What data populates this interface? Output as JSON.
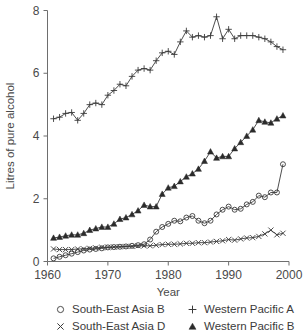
{
  "chart_data": {
    "type": "line",
    "title": "",
    "xlabel": "Year",
    "ylabel": "Litres of pure alcohol",
    "xlim": [
      1960,
      2000
    ],
    "ylim": [
      0,
      8
    ],
    "xticks": [
      1960,
      1970,
      1980,
      1990,
      2000
    ],
    "yticks": [
      0,
      2,
      4,
      6,
      8
    ],
    "xtick_labels": [
      "1960",
      "1970",
      "1980",
      "1990",
      "2000"
    ],
    "ytick_labels": [
      "0",
      "2",
      "4",
      "6",
      "8"
    ],
    "grid": false,
    "legend_position": "below",
    "x": [
      1961,
      1962,
      1963,
      1964,
      1965,
      1966,
      1967,
      1968,
      1969,
      1970,
      1971,
      1972,
      1973,
      1974,
      1975,
      1976,
      1977,
      1978,
      1979,
      1980,
      1981,
      1982,
      1983,
      1984,
      1985,
      1986,
      1987,
      1988,
      1989,
      1990,
      1991,
      1992,
      1993,
      1994,
      1995,
      1996,
      1997,
      1998,
      1999
    ],
    "series": [
      {
        "name": "Western Pacific A",
        "marker": "plus",
        "values": [
          4.55,
          4.6,
          4.72,
          4.75,
          4.5,
          4.72,
          5.0,
          5.05,
          5.0,
          5.3,
          5.45,
          5.65,
          5.6,
          5.9,
          6.1,
          6.15,
          6.1,
          6.4,
          6.65,
          6.7,
          6.6,
          7.0,
          7.35,
          7.15,
          7.2,
          7.15,
          7.2,
          7.8,
          7.1,
          7.4,
          7.1,
          7.2,
          7.2,
          7.2,
          7.15,
          7.1,
          7.0,
          6.85,
          6.75
        ]
      },
      {
        "name": "Western Pacific B",
        "marker": "triangle",
        "values": [
          0.75,
          0.78,
          0.82,
          0.85,
          0.85,
          0.9,
          1.0,
          1.05,
          1.1,
          1.1,
          1.2,
          1.35,
          1.4,
          1.5,
          1.62,
          1.8,
          1.75,
          1.75,
          2.15,
          2.35,
          2.4,
          2.55,
          2.7,
          2.8,
          2.95,
          3.2,
          3.5,
          3.3,
          3.35,
          3.35,
          3.6,
          3.8,
          4.0,
          4.2,
          4.5,
          4.45,
          4.42,
          4.55,
          4.65
        ]
      },
      {
        "name": "South-East Asia B",
        "marker": "circle",
        "values": [
          0.1,
          0.15,
          0.2,
          0.25,
          0.3,
          0.35,
          0.38,
          0.4,
          0.42,
          0.45,
          0.46,
          0.47,
          0.48,
          0.5,
          0.52,
          0.55,
          0.7,
          0.95,
          1.1,
          1.2,
          1.3,
          1.28,
          1.4,
          1.45,
          1.3,
          1.22,
          1.3,
          1.5,
          1.65,
          1.75,
          1.65,
          1.68,
          1.82,
          1.9,
          2.1,
          2.05,
          2.2,
          2.2,
          3.1
        ]
      },
      {
        "name": "South-East Asia D",
        "marker": "cross",
        "values": [
          0.4,
          0.38,
          0.38,
          0.38,
          0.4,
          0.4,
          0.42,
          0.43,
          0.45,
          0.45,
          0.46,
          0.47,
          0.48,
          0.48,
          0.5,
          0.5,
          0.5,
          0.52,
          0.54,
          0.55,
          0.55,
          0.56,
          0.58,
          0.58,
          0.6,
          0.6,
          0.62,
          0.64,
          0.66,
          0.7,
          0.68,
          0.72,
          0.75,
          0.76,
          0.8,
          0.88,
          1.0,
          0.85,
          0.9
        ]
      }
    ]
  },
  "legend": {
    "entries": [
      {
        "label": "South-East Asia B",
        "glyph": "circle-marker-icon"
      },
      {
        "label": "Western Pacific A",
        "glyph": "plus-marker-icon"
      },
      {
        "label": "South-East Asia D",
        "glyph": "cross-marker-icon"
      },
      {
        "label": "Western Pacific B",
        "glyph": "triangle-marker-icon"
      }
    ]
  }
}
